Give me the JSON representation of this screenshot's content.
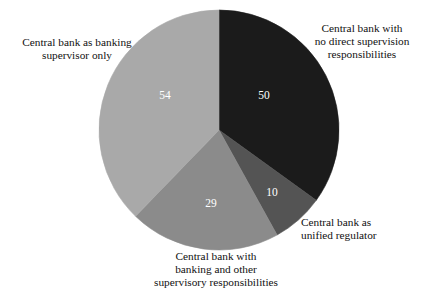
{
  "chart_data": {
    "type": "pie",
    "title": "",
    "subtitle": "",
    "categories": [
      "Central bank with no direct supervision responsibilities",
      "Central bank as unified regulator",
      "Central bank with banking and other supervisory responsibilities",
      "Central bank as banking supervisor only"
    ],
    "values": [
      50,
      10,
      29,
      54
    ],
    "total": 143,
    "value_labels": [
      "50",
      "10",
      "29",
      "54"
    ],
    "colors": [
      "#1b1b1b",
      "#545454",
      "#8b8b8b",
      "#a9a9a9"
    ],
    "legend_position": "callouts",
    "grid": false,
    "start_angle_deg": 0,
    "direction": "clockwise",
    "slices": [
      {
        "id": "no-direct-supervision",
        "label": "Central bank with\nno direct supervision\nresponsibilities",
        "value": 50,
        "value_label": "50",
        "color": "#1b1b1b",
        "value_text_color": "#ffffff"
      },
      {
        "id": "unified-regulator",
        "label": "Central bank as\nunified regulator",
        "value": 10,
        "value_label": "10",
        "color": "#545454",
        "value_text_color": "#ffffff"
      },
      {
        "id": "banking-and-other",
        "label": "Central bank with\nbanking and other\nsupervisory responsibilities",
        "value": 29,
        "value_label": "29",
        "color": "#8b8b8b",
        "value_text_color": "#ffffff"
      },
      {
        "id": "banking-supervisor-only",
        "label": "Central bank as banking\nsupervisor only",
        "value": 54,
        "value_label": "54",
        "color": "#a9a9a9",
        "value_text_color": "#ffffff"
      }
    ]
  },
  "callouts": {
    "top_right": "Central bank with\nno direct supervision\nresponsibilities",
    "bottom_right": "Central bank as\nunified regulator",
    "bottom": "Central bank with\nbanking and other\nsupervisory responsibilities",
    "left": "Central bank as banking\nsupervisor only"
  },
  "values": {
    "slice_50": "50",
    "slice_10": "10",
    "slice_29": "29",
    "slice_54": "54"
  }
}
